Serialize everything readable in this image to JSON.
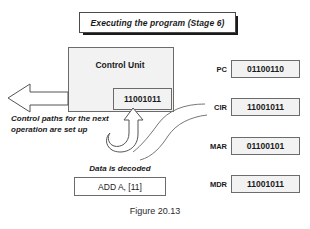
{
  "figure": {
    "caption": "Figure 20.13",
    "title_banner": "Executing the program (Stage 6)"
  },
  "control_unit": {
    "label": "Control Unit",
    "inner_value": "11001011"
  },
  "annotations": {
    "control_paths": "Control paths for the next operation are set up",
    "data_decoded": "Data is decoded",
    "decoded_instruction": "ADD A, [11]"
  },
  "registers": [
    {
      "name": "PC",
      "value": "01100110"
    },
    {
      "name": "CIR",
      "value": "11001011"
    },
    {
      "name": "MAR",
      "value": "01100101"
    },
    {
      "name": "MDR",
      "value": "11001011"
    }
  ],
  "colors": {
    "box_fill": "#f2f2f2",
    "box_stroke": "#6b6b6b",
    "text": "#1a1a1a",
    "shadow": "#1a1a1a",
    "background": "#ffffff"
  },
  "icons": {
    "left_block_arrow": "left-block-arrow-icon",
    "up_block_arrow": "up-curved-block-arrow-icon",
    "curved_arrow": "curved-arrow-icon"
  }
}
